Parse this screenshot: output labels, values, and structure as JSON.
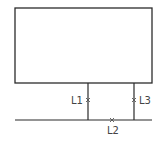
{
  "diagram": {
    "type": "wiring-schematic",
    "colors": {
      "line": "#2b2b2b",
      "text": "#444444",
      "background": "#ffffff"
    },
    "box": {
      "label": ""
    },
    "markers": [
      {
        "id": "L1",
        "label": "L1",
        "position": "left vertical lead"
      },
      {
        "id": "L2",
        "label": "L2",
        "position": "horizontal bus"
      },
      {
        "id": "L3",
        "label": "L3",
        "position": "right vertical lead"
      }
    ]
  }
}
